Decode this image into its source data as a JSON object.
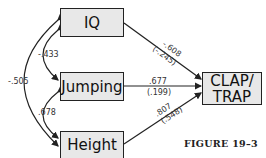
{
  "nodes": {
    "iq": {
      "label": "IQ"
    },
    "jumping": {
      "label": "Jumping"
    },
    "height": {
      "label": "Height"
    },
    "clap_trap": {
      "line1": "CLAP/",
      "line2": "TRAP"
    }
  },
  "correlations": {
    "iq_jumping": "-.433",
    "jumping_height": ".678",
    "iq_height": "-.505"
  },
  "paths": {
    "iq_to_clap": {
      "coef": "-.608",
      "se": "(-.245)"
    },
    "jumping_to_clap": {
      "coef": ".677",
      "se": "(.199)"
    },
    "height_to_clap": {
      "coef": ".807",
      "se": "(.548)"
    }
  },
  "caption": "FIGURE 19–3",
  "colors": {
    "box_fill": "#e8e8e8",
    "stroke": "#222222"
  }
}
